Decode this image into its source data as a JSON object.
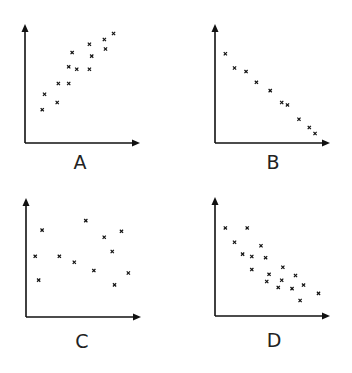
{
  "chart_data": [
    {
      "type": "scatter",
      "title": "A",
      "xlabel": "",
      "ylabel": "",
      "xlim": [
        0,
        100
      ],
      "ylim": [
        0,
        100
      ],
      "grid": false,
      "ticks": false,
      "marker": "x",
      "description": "Strong positive correlation",
      "points": [
        [
          15,
          28
        ],
        [
          17,
          41
        ],
        [
          28,
          34
        ],
        [
          29,
          50
        ],
        [
          38,
          50
        ],
        [
          38,
          64
        ],
        [
          41,
          76
        ],
        [
          45,
          62
        ],
        [
          56,
          62
        ],
        [
          56,
          83
        ],
        [
          58,
          73
        ],
        [
          69,
          87
        ],
        [
          70,
          79
        ],
        [
          77,
          92
        ]
      ]
    },
    {
      "type": "scatter",
      "title": "B",
      "xlabel": "",
      "ylabel": "",
      "xlim": [
        0,
        100
      ],
      "ylim": [
        0,
        100
      ],
      "grid": false,
      "ticks": false,
      "marker": "x",
      "description": "Strong negative correlation",
      "points": [
        [
          9,
          75
        ],
        [
          17,
          63
        ],
        [
          27,
          60
        ],
        [
          36,
          51
        ],
        [
          48,
          44
        ],
        [
          58,
          34
        ],
        [
          63,
          32
        ],
        [
          73,
          20
        ],
        [
          82,
          13
        ],
        [
          87,
          8
        ]
      ]
    },
    {
      "type": "scatter",
      "title": "C",
      "xlabel": "",
      "ylabel": "",
      "xlim": [
        0,
        100
      ],
      "ylim": [
        0,
        100
      ],
      "grid": false,
      "ticks": false,
      "marker": "x",
      "description": "No correlation",
      "points": [
        [
          8,
          51
        ],
        [
          11,
          31
        ],
        [
          14,
          73
        ],
        [
          29,
          51
        ],
        [
          42,
          46
        ],
        [
          52,
          81
        ],
        [
          59,
          39
        ],
        [
          68,
          67
        ],
        [
          75,
          55
        ],
        [
          77,
          27
        ],
        [
          83,
          72
        ],
        [
          89,
          37
        ]
      ]
    },
    {
      "type": "scatter",
      "title": "D",
      "xlabel": "",
      "ylabel": "",
      "xlim": [
        0,
        100
      ],
      "ylim": [
        0,
        100
      ],
      "grid": false,
      "ticks": false,
      "marker": "x",
      "description": "Moderate negative correlation",
      "points": [
        [
          9,
          74
        ],
        [
          28,
          74
        ],
        [
          17,
          62
        ],
        [
          40,
          59
        ],
        [
          24,
          52
        ],
        [
          32,
          50
        ],
        [
          44,
          49
        ],
        [
          59,
          41
        ],
        [
          32,
          39
        ],
        [
          47,
          35
        ],
        [
          70,
          34
        ],
        [
          45,
          29
        ],
        [
          58,
          30
        ],
        [
          77,
          26
        ],
        [
          55,
          24
        ],
        [
          67,
          23
        ],
        [
          90,
          19
        ],
        [
          74,
          13
        ]
      ]
    }
  ],
  "panels": [
    {
      "label": "A"
    },
    {
      "label": "B"
    },
    {
      "label": "C"
    },
    {
      "label": "D"
    }
  ],
  "colors": {
    "axis": "#111111",
    "marker": "#111111",
    "label": "#222222",
    "background": "#ffffff"
  }
}
